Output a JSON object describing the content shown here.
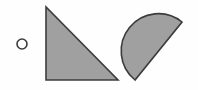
{
  "canvas": {
    "width": 198,
    "height": 90,
    "background_color": "#fefefe",
    "title": "geometric-shapes-figure"
  },
  "style": {
    "fill_color": "#a0a0a0",
    "stroke_color": "#3c3c3c",
    "stroke_width": 1.6,
    "unfilled_color": "none"
  },
  "shapes": [
    {
      "id": "small-circle",
      "kind": "circle",
      "label": "small unfilled circle",
      "filled": false,
      "fill": "none",
      "stroke": "#3c3c3c",
      "stroke_width": 1.6,
      "cx": 22,
      "cy": 44,
      "r": 5
    },
    {
      "id": "right-triangle",
      "kind": "triangle",
      "label": "gray right triangle",
      "filled": true,
      "fill": "#a0a0a0",
      "stroke": "#3c3c3c",
      "stroke_width": 1.6,
      "points": "46,7 46,80 118,80",
      "vertices": [
        [
          46,
          7
        ],
        [
          46,
          80
        ],
        [
          118,
          80
        ]
      ]
    },
    {
      "id": "half-disk",
      "kind": "semicircle",
      "label": "gray half disk rotated",
      "filled": true,
      "fill": "#a0a0a0",
      "stroke": "#3c3c3c",
      "stroke_width": 1.6,
      "center": [
        158.5,
        51
      ],
      "radius": 37.3,
      "diameter_start": [
        135,
        80
      ],
      "diameter_end": [
        182,
        22
      ],
      "path": "M 135 80 A 37.3 37.3 0 0 1 182 22 L 135 80 Z"
    }
  ]
}
